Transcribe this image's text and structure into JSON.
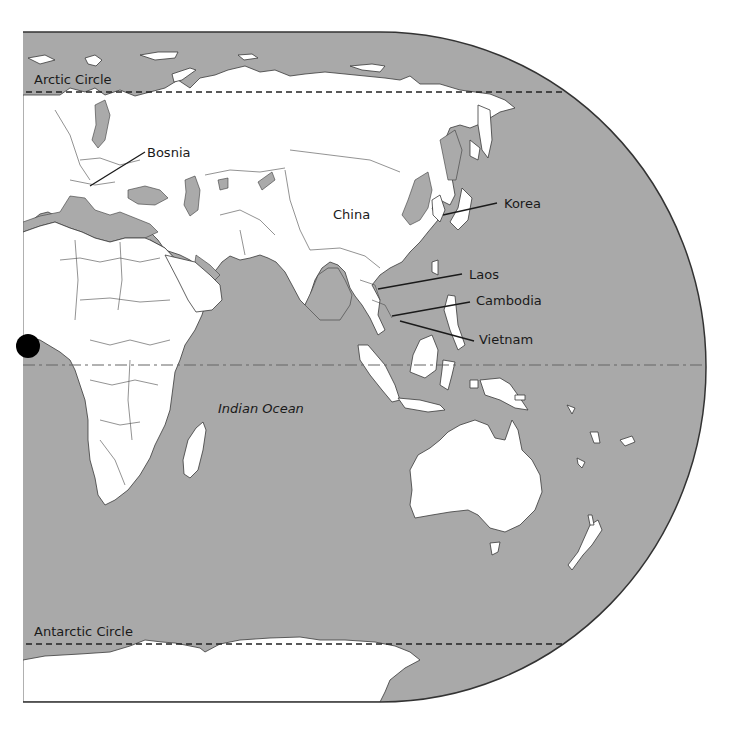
{
  "map": {
    "title": "Eastern Hemisphere outline map",
    "colors": {
      "ocean": "#a9a9a9",
      "land": "#ffffff",
      "outline": "#333333",
      "marker": "#000000"
    },
    "lines": {
      "arctic_circle": "Arctic Circle",
      "antarctic_circle": "Antarctic Circle",
      "equator": ""
    },
    "labels": {
      "bosnia": "Bosnia",
      "china": "China",
      "korea": "Korea",
      "laos": "Laos",
      "cambodia": "Cambodia",
      "vietnam": "Vietnam",
      "indian_ocean": "Indian Ocean"
    },
    "marker": {
      "name": "location-dot",
      "position_hint": "West Africa coast near equator"
    }
  }
}
